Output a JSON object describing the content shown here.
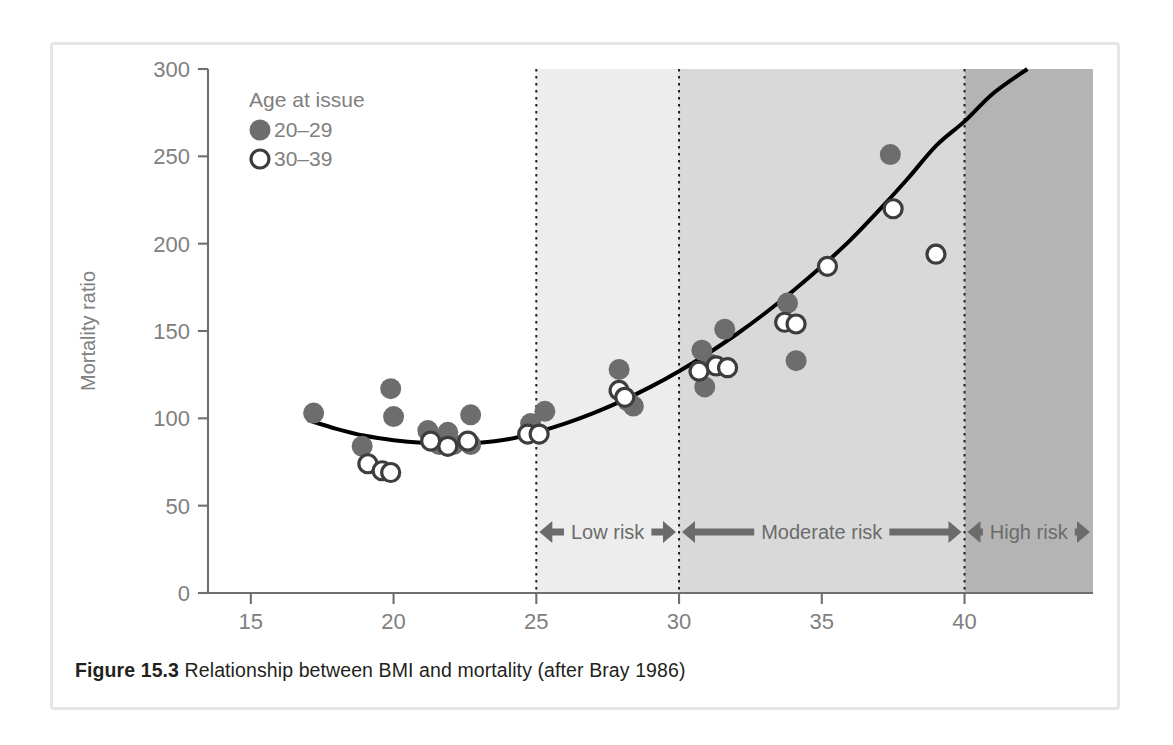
{
  "caption": {
    "label": "Figure 15.3",
    "text": "Relationship between BMI and mortality (after Bray 1986)"
  },
  "legend": {
    "title": "Age at issue",
    "entries": [
      {
        "marker": "filled-circle",
        "label": "20–29"
      },
      {
        "marker": "open-circle",
        "label": "30–39"
      }
    ]
  },
  "risk_bands": [
    {
      "label": "Low risk",
      "from": 25,
      "to": 30,
      "fill": "#ededed"
    },
    {
      "label": "Moderate risk",
      "from": 30,
      "to": 40,
      "fill": "#d9d9d9"
    },
    {
      "label": "High risk",
      "from": 40,
      "to": 44.5,
      "fill": "#b4b4b4"
    }
  ],
  "colors": {
    "filled_marker": "#6d6d6d",
    "open_marker_stroke": "#3d3d3d",
    "curve": "#000000",
    "axis": "#6f6f6f",
    "tick_label": "#808080",
    "frame": "#e6e6e6",
    "caption_text": "#231f20"
  },
  "chart_data": {
    "type": "scatter",
    "title": "",
    "xlabel": "Body mass index (kg m⁻²)",
    "ylabel": "Mortality ratio",
    "xlim": [
      13.5,
      44.5
    ],
    "ylim": [
      0,
      300
    ],
    "xticks": [
      15,
      20,
      25,
      30,
      35,
      40
    ],
    "yticks": [
      0,
      50,
      100,
      150,
      200,
      250,
      300
    ],
    "grid": false,
    "legend_position": "top-left",
    "series": [
      {
        "name": "20–29",
        "marker": "filled-circle",
        "points": [
          [
            17.2,
            103
          ],
          [
            18.9,
            84
          ],
          [
            19.9,
            117
          ],
          [
            20.0,
            101
          ],
          [
            21.2,
            93
          ],
          [
            21.9,
            92
          ],
          [
            22.7,
            102
          ],
          [
            21.6,
            85
          ],
          [
            22.1,
            85
          ],
          [
            22.7,
            85
          ],
          [
            24.8,
            97
          ],
          [
            24.9,
            92
          ],
          [
            25.3,
            104
          ],
          [
            27.9,
            128
          ],
          [
            28.2,
            110
          ],
          [
            28.4,
            107
          ],
          [
            30.8,
            139
          ],
          [
            30.9,
            118
          ],
          [
            31.6,
            151
          ],
          [
            31.1,
            131
          ],
          [
            33.8,
            166
          ],
          [
            34.1,
            133
          ],
          [
            37.4,
            251
          ]
        ]
      },
      {
        "name": "30–39",
        "marker": "open-circle",
        "points": [
          [
            19.1,
            74
          ],
          [
            19.6,
            70
          ],
          [
            19.9,
            69
          ],
          [
            21.3,
            87
          ],
          [
            21.9,
            84
          ],
          [
            22.6,
            87
          ],
          [
            24.7,
            91
          ],
          [
            25.1,
            91
          ],
          [
            27.9,
            116
          ],
          [
            28.1,
            112
          ],
          [
            30.7,
            127
          ],
          [
            31.3,
            130
          ],
          [
            31.7,
            129
          ],
          [
            33.7,
            155
          ],
          [
            34.1,
            154
          ],
          [
            35.2,
            187
          ],
          [
            37.5,
            220
          ],
          [
            39.0,
            194
          ]
        ]
      }
    ],
    "fit_curve": {
      "name": "fitted mortality curve",
      "points": [
        [
          17.0,
          99
        ],
        [
          18.0,
          94
        ],
        [
          19.0,
          90
        ],
        [
          20.0,
          87.5
        ],
        [
          21.0,
          86
        ],
        [
          22.0,
          85.5
        ],
        [
          23.0,
          86
        ],
        [
          24.0,
          88
        ],
        [
          25.0,
          92
        ],
        [
          26.0,
          97
        ],
        [
          27.0,
          103
        ],
        [
          28.0,
          110
        ],
        [
          29.0,
          118
        ],
        [
          30.0,
          127
        ],
        [
          31.0,
          137
        ],
        [
          32.0,
          148
        ],
        [
          33.0,
          160
        ],
        [
          34.0,
          173
        ],
        [
          35.0,
          187
        ],
        [
          36.0,
          202
        ],
        [
          37.0,
          219
        ],
        [
          38.0,
          237
        ],
        [
          39.0,
          256
        ],
        [
          40.0,
          270
        ],
        [
          41.0,
          286
        ],
        [
          42.2,
          300
        ]
      ]
    }
  }
}
